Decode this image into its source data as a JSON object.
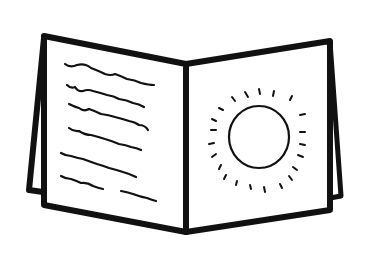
{
  "illustration": {
    "subject": "open book / greeting card line drawing",
    "stroke_color": "#111111",
    "background_color": "#ffffff",
    "left_page": {
      "content": "handwritten text lines",
      "line_count": 7
    },
    "right_page": {
      "content": "sun drawing",
      "ray_count": 22
    }
  }
}
